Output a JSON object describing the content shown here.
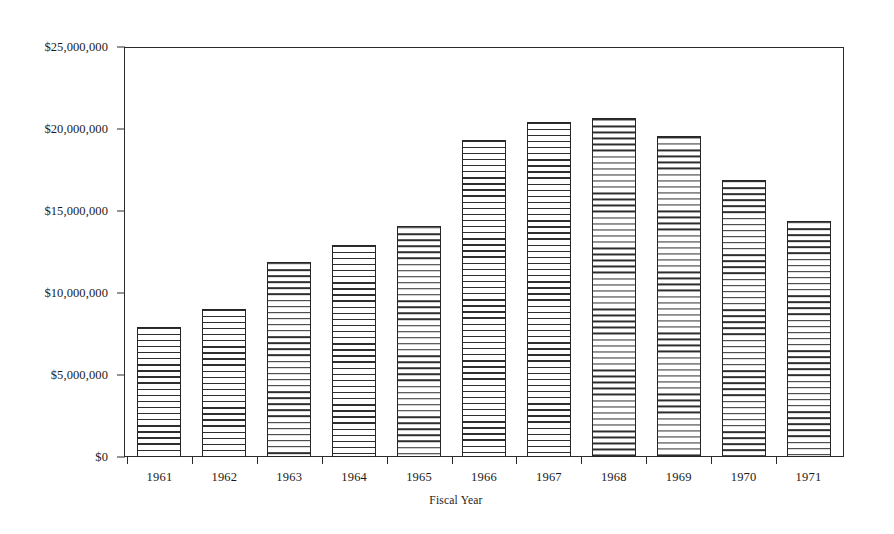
{
  "chart_data": {
    "type": "bar",
    "title": "",
    "subtitle": "",
    "xlabel": "Fiscal Year",
    "ylabel": "",
    "categories": [
      "1961",
      "1962",
      "1963",
      "1964",
      "1965",
      "1966",
      "1967",
      "1968",
      "1969",
      "1970",
      "1971"
    ],
    "values": [
      7900000,
      9000000,
      11900000,
      12900000,
      14100000,
      19300000,
      20400000,
      20700000,
      19600000,
      16900000,
      14400000
    ],
    "series": [
      {
        "name": "Amount",
        "values": [
          7900000,
          9000000,
          11900000,
          12900000,
          14100000,
          19300000,
          20400000,
          20700000,
          19600000,
          16900000,
          14400000
        ]
      }
    ],
    "ylim": [
      0,
      25000000
    ],
    "y_ticks": [
      0,
      5000000,
      10000000,
      15000000,
      20000000,
      25000000
    ],
    "y_tick_labels": [
      "$0",
      "$5,000,000",
      "$10,000,000",
      "$15,000,000",
      "$20,000,000",
      "$25,000,000"
    ],
    "grid": false,
    "legend": false,
    "legend_position": "none",
    "bar_fill": "horizontal-line-hatch",
    "bar_edge_color": "#262626",
    "plot_border": true,
    "background_color": "#ffffff"
  },
  "axes": {
    "y": {
      "ticks": [
        {
          "label": "$25,000,000",
          "value": 25000000
        },
        {
          "label": "$20,000,000",
          "value": 20000000
        },
        {
          "label": "$15,000,000",
          "value": 15000000
        },
        {
          "label": "$10,000,000",
          "value": 10000000
        },
        {
          "label": "$5,000,000",
          "value": 5000000
        },
        {
          "label": "$0",
          "value": 0
        }
      ]
    },
    "x": {
      "title": "Fiscal Year",
      "ticks": [
        {
          "label": "1961",
          "value": 7900000
        },
        {
          "label": "1962",
          "value": 9000000
        },
        {
          "label": "1963",
          "value": 11900000
        },
        {
          "label": "1964",
          "value": 12900000
        },
        {
          "label": "1965",
          "value": 14100000
        },
        {
          "label": "1966",
          "value": 19300000
        },
        {
          "label": "1967",
          "value": 20400000
        },
        {
          "label": "1968",
          "value": 20700000
        },
        {
          "label": "1969",
          "value": 19600000
        },
        {
          "label": "1970",
          "value": 16900000
        },
        {
          "label": "1971",
          "value": 14400000
        }
      ]
    }
  }
}
